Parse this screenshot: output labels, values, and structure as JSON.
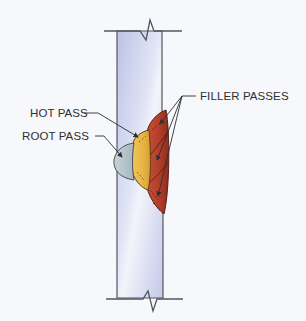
{
  "diagram": {
    "labels": {
      "hot_pass": "HOT PASS",
      "root_pass": "ROOT PASS",
      "filler_passes": "FILLER PASSES"
    },
    "components": [
      {
        "id": "pipe-wall",
        "name": "Pipe wall (cross-section)",
        "color": "#c9cdea"
      },
      {
        "id": "root-pass",
        "name": "ROOT PASS",
        "color": "#b4c3cb"
      },
      {
        "id": "hot-pass",
        "name": "HOT PASS",
        "color": "#e9b949"
      },
      {
        "id": "filler-passes",
        "name": "FILLER PASSES",
        "color": "#b8412c"
      }
    ],
    "colors": {
      "background": "#f7f8fb",
      "outline": "#4a4a55",
      "wall_light": "#eef0fa",
      "wall_dark": "#b9bfe3",
      "root": "#b4c3cb",
      "hot": "#e9b949",
      "filler": "#b8412c",
      "filler_dark": "#8c2d1f"
    }
  }
}
